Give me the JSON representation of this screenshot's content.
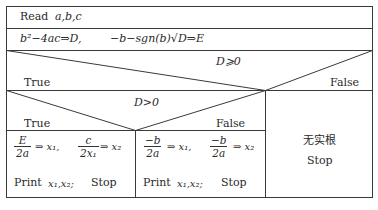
{
  "read_row": {
    "keyword": "Read",
    "vars": "a,b,c"
  },
  "compute_row": {
    "left": "b²−4ac⇒D,",
    "right": "−b−sgn(b)√D⇒E"
  },
  "decision1": {
    "condition": "D⩾0",
    "true_label": "True",
    "false_label": "False"
  },
  "decision2": {
    "condition": "D>0",
    "true_label": "True",
    "false_label": "False"
  },
  "branch_d_pos": {
    "frac1_num": "E",
    "frac1_den": "2a",
    "assign1": "⇒ x₁,",
    "frac2_num": "c",
    "frac2_den": "2x₁",
    "assign2": "⇒ x₂",
    "print": "Print",
    "print_vars": "x₁,x₂;",
    "stop": "Stop"
  },
  "branch_d_zero": {
    "frac1_num": "−b",
    "frac1_den": "2a",
    "assign1": "⇒ x₁,",
    "frac2_num": "−b",
    "frac2_den": "2a",
    "assign2": "⇒ x₂",
    "print": "Print",
    "print_vars": "x₁,x₂;",
    "stop": "Stop"
  },
  "branch_neg": {
    "message": "无实根",
    "stop": "Stop"
  }
}
